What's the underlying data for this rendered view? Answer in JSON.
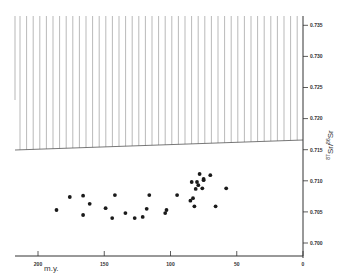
{
  "chart_data": {
    "type": "scatter",
    "title": "",
    "xlabel": "m.y.",
    "ylabel": "87Sr/86Sr",
    "xlim": [
      200,
      0
    ],
    "ylim": [
      0.7,
      0.735
    ],
    "x_ticks": [
      "200",
      "150",
      "100",
      "50",
      "0"
    ],
    "y_ticks": [
      "0.735",
      "0.730",
      "0.725",
      "0.720",
      "0.715",
      "0.710",
      "0.705",
      "0.700"
    ],
    "grid": false,
    "legend": null,
    "annotations": [
      {
        "type": "hatched_region",
        "description": "vertical-hatched band above a sloping boundary from ~0.7145 at 200 m.y. to ~0.716 at 0 m.y., extending to top of plot"
      }
    ],
    "series": [
      {
        "name": "samples",
        "points": [
          [
            186,
            0.7053
          ],
          [
            176,
            0.7074
          ],
          [
            166,
            0.7076
          ],
          [
            161,
            0.7063
          ],
          [
            166,
            0.7045
          ],
          [
            149,
            0.7056
          ],
          [
            142,
            0.7077
          ],
          [
            144,
            0.704
          ],
          [
            134,
            0.7048
          ],
          [
            127,
            0.704
          ],
          [
            116,
            0.7077
          ],
          [
            118,
            0.7055
          ],
          [
            121,
            0.7042
          ],
          [
            104,
            0.7048
          ],
          [
            103,
            0.7053
          ],
          [
            95,
            0.7077
          ],
          [
            85,
            0.7068
          ],
          [
            83,
            0.7072
          ],
          [
            84,
            0.7098
          ],
          [
            80,
            0.7098
          ],
          [
            81,
            0.7087
          ],
          [
            79,
            0.7093
          ],
          [
            76,
            0.7088
          ],
          [
            75,
            0.7101
          ],
          [
            78,
            0.7111
          ],
          [
            75,
            0.7103
          ],
          [
            70,
            0.7109
          ],
          [
            82,
            0.7059
          ],
          [
            66,
            0.7059
          ],
          [
            58,
            0.7088
          ]
        ]
      }
    ]
  },
  "axes": {
    "x_unit": "m.y.",
    "y_label_sup1": "87",
    "y_label_base1": "Sr",
    "y_label_sep": "/",
    "y_label_sup2": "86",
    "y_label_base2": "Sr"
  }
}
